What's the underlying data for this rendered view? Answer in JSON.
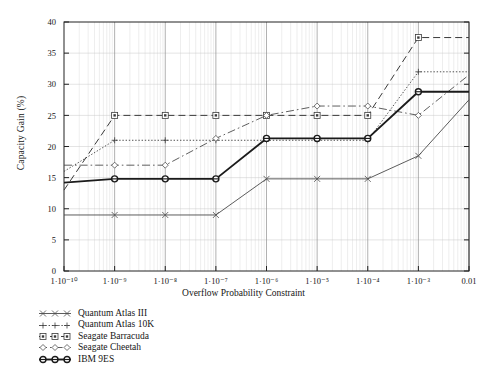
{
  "chart_data": {
    "type": "line",
    "title": "",
    "xlabel": "Overflow Probability Constraint",
    "ylabel": "Capacity Gain (%)",
    "x_scale": "log",
    "x_tick_labels": [
      "1·10⁻¹⁰",
      "1·10⁻⁹",
      "1·10⁻⁸",
      "1·10⁻⁷",
      "1·10⁻⁶",
      "1·10⁻⁵",
      "1·10⁻⁴",
      "1·10⁻³",
      "0.01"
    ],
    "x_tick_exponents": [
      -10,
      -9,
      -8,
      -7,
      -6,
      -5,
      -4,
      -3,
      -2
    ],
    "xlim": [
      -10,
      -2
    ],
    "ylim": [
      0,
      40
    ],
    "y_tick_labels": [
      "0",
      "5",
      "10",
      "15",
      "20",
      "25",
      "30",
      "35",
      "40"
    ],
    "y_ticks": [
      0,
      5,
      10,
      15,
      20,
      25,
      30,
      35,
      40
    ],
    "grid": true,
    "grid_note": "vertical minor log gridlines plus major vertical/horizontal gridlines",
    "legend_position": "below-left",
    "series": [
      {
        "name": "Quantum Atlas III",
        "marker": "x",
        "dash": "solid",
        "color": "#4a4a4a",
        "width": 0.9,
        "x": [
          -10,
          -9,
          -8,
          -7,
          -6,
          -5,
          -4,
          -3,
          -2
        ],
        "values": [
          9,
          9,
          9,
          9,
          14.8,
          14.8,
          14.8,
          18.5,
          27.5
        ]
      },
      {
        "name": "Quantum Atlas 10K",
        "marker": "plus",
        "dash": "dotted",
        "color": "#3d3d3d",
        "width": 0.9,
        "x": [
          -10,
          -9,
          -8,
          -7,
          -6,
          -5,
          -4,
          -3,
          -2
        ],
        "values": [
          16,
          21,
          21,
          21,
          21,
          21,
          21,
          32,
          32
        ]
      },
      {
        "name": "Seagate Barracuda",
        "marker": "square",
        "dash": "dashed",
        "color": "#3a3a3a",
        "width": 1.0,
        "x": [
          -10,
          -9,
          -8,
          -7,
          -6,
          -5,
          -4,
          -3,
          -2
        ],
        "values": [
          13,
          25,
          25,
          25,
          25,
          25,
          25,
          37.5,
          37.5
        ]
      },
      {
        "name": "Seagate Cheetah",
        "marker": "diamond",
        "dash": "dashdot",
        "color": "#4d4d4d",
        "width": 0.9,
        "x": [
          -10,
          -9,
          -8,
          -7,
          -6,
          -5,
          -4,
          -3,
          -2
        ],
        "values": [
          17,
          17,
          17,
          21.3,
          25,
          26.5,
          26.5,
          25,
          31.5
        ]
      },
      {
        "name": "IBM 9ES",
        "marker": "circle",
        "dash": "solid",
        "color": "#1b1b1b",
        "width": 1.9,
        "x": [
          -10,
          -9,
          -8,
          -7,
          -6,
          -5,
          -4,
          -3,
          -2
        ],
        "values": [
          14.2,
          14.8,
          14.8,
          14.8,
          21.3,
          21.3,
          21.3,
          28.8,
          28.8
        ]
      }
    ]
  },
  "legend": {
    "items": [
      {
        "label": "Quantum Atlas III",
        "marker": "x-marker"
      },
      {
        "label": "Quantum Atlas 10K",
        "marker": "plus-marker"
      },
      {
        "label": "Seagate Barracuda",
        "marker": "square-marker"
      },
      {
        "label": "Seagate Cheetah",
        "marker": "diamond-marker"
      },
      {
        "label": "IBM 9ES",
        "marker": "circle-marker"
      }
    ]
  }
}
